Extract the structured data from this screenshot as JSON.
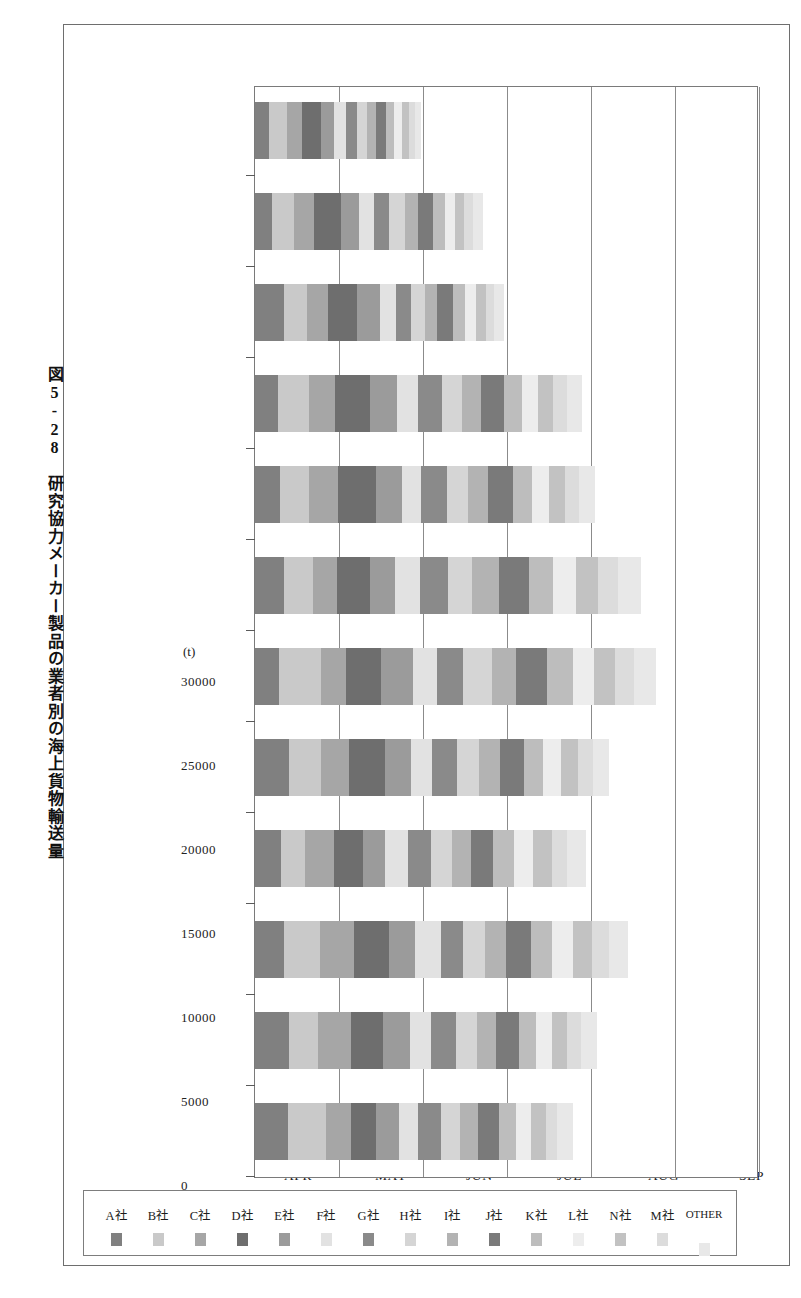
{
  "figure": {
    "caption": "図5-28　研究協力メーカー製品の業者別の海上貨物輸送量",
    "caption_number": "図5-28",
    "caption_title": "研究協力メーカー製品の業者別の海上貨物輸送量"
  },
  "chart_data": {
    "type": "bar",
    "orientation": "vertical-stacked",
    "title": "研究協力メーカー製品の業者別の海上貨物輸送量",
    "xlabel": "",
    "ylabel": "(t)",
    "unit": "(t)",
    "ylim": [
      0,
      30000
    ],
    "yticks": [
      0,
      5000,
      10000,
      15000,
      20000,
      25000,
      30000
    ],
    "ytick_labels": [
      "0",
      "5000",
      "10000",
      "15000",
      "20000",
      "25000",
      "30000"
    ],
    "grid": true,
    "legend_position": "left",
    "categories": [
      "APR",
      "MAY",
      "JUN",
      "JUL",
      "AUG",
      "SEP",
      "OCT",
      "NOV",
      "DEC",
      "JAN",
      "FEB",
      "MAR"
    ],
    "series": [
      {
        "name": "A社",
        "color": "#808080",
        "values": [
          1950,
          2050,
          1700,
          1550,
          2000,
          1450,
          1750,
          1500,
          1350,
          1700,
          1000,
          850
        ]
      },
      {
        "name": "B社",
        "color": "#c9c9c9",
        "values": [
          2300,
          1700,
          2150,
          1450,
          1900,
          2450,
          1700,
          1700,
          1850,
          1400,
          1350,
          1050
        ]
      },
      {
        "name": "C社",
        "color": "#a6a6a6",
        "values": [
          1450,
          1950,
          2050,
          1700,
          1700,
          1500,
          1450,
          1750,
          1550,
          1250,
          1150,
          900
        ]
      },
      {
        "name": "D社",
        "color": "#6e6e6e",
        "values": [
          1500,
          1900,
          2100,
          1750,
          2150,
          2100,
          1950,
          2250,
          2100,
          1750,
          1600,
          1100
        ]
      },
      {
        "name": "E社",
        "color": "#9b9b9b",
        "values": [
          1400,
          1650,
          1500,
          1300,
          1550,
          1900,
          1500,
          1550,
          1600,
          1350,
          1100,
          800
        ]
      },
      {
        "name": "F社",
        "color": "#e2e2e2",
        "values": [
          1100,
          1200,
          1550,
          1350,
          1250,
          1450,
          1500,
          1150,
          1250,
          950,
          900,
          700
        ]
      },
      {
        "name": "G社",
        "color": "#8a8a8a",
        "values": [
          1350,
          1500,
          1350,
          1400,
          1500,
          1550,
          1650,
          1500,
          1450,
          900,
          850,
          650
        ]
      },
      {
        "name": "H社",
        "color": "#d5d5d5",
        "values": [
          1150,
          1250,
          1300,
          1200,
          1300,
          1700,
          1400,
          1300,
          1200,
          800,
          950,
          600
        ]
      },
      {
        "name": "I社",
        "color": "#b3b3b3",
        "values": [
          1050,
          1150,
          1250,
          1150,
          1250,
          1450,
          1600,
          1150,
          1100,
          750,
          800,
          550
        ]
      },
      {
        "name": "J社",
        "color": "#7a7a7a",
        "values": [
          1300,
          1350,
          1450,
          1300,
          1400,
          1850,
          1800,
          1500,
          1350,
          950,
          900,
          600
        ]
      },
      {
        "name": "K社",
        "color": "#bdbdbd",
        "values": [
          1000,
          1050,
          1300,
          1250,
          1150,
          1500,
          1450,
          1150,
          1100,
          700,
          700,
          500
        ]
      },
      {
        "name": "L社",
        "color": "#ededed",
        "values": [
          900,
          950,
          1200,
          1150,
          1050,
          1300,
          1350,
          1000,
          950,
          650,
          600,
          450
        ]
      },
      {
        "name": "N社",
        "color": "#c2c2c2",
        "values": [
          850,
          900,
          1150,
          1100,
          1000,
          1250,
          1300,
          950,
          900,
          600,
          550,
          400
        ]
      },
      {
        "name": "M社",
        "color": "#dcdcdc",
        "values": [
          700,
          800,
          1000,
          950,
          900,
          1100,
          1200,
          850,
          800,
          500,
          500,
          350
        ]
      },
      {
        "name": "OTHER",
        "color": "#e8e8e8",
        "values": [
          900,
          950,
          1150,
          1100,
          1000,
          1300,
          1400,
          950,
          900,
          600,
          600,
          400
        ]
      }
    ]
  },
  "legend": {
    "items": [
      {
        "label": "A社"
      },
      {
        "label": "B社"
      },
      {
        "label": "C社"
      },
      {
        "label": "D社"
      },
      {
        "label": "E社"
      },
      {
        "label": "F社"
      },
      {
        "label": "G社"
      },
      {
        "label": "H社"
      },
      {
        "label": "I社"
      },
      {
        "label": "J社"
      },
      {
        "label": "K社"
      },
      {
        "label": "L社"
      },
      {
        "label": "N社"
      },
      {
        "label": "M社"
      },
      {
        "label": "OTHER"
      }
    ]
  }
}
